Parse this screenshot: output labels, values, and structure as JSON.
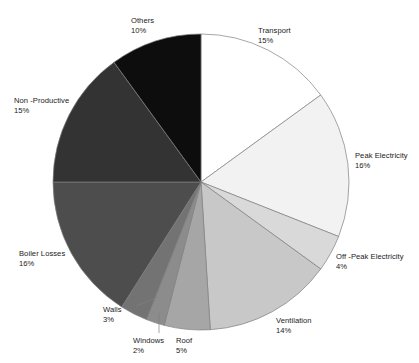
{
  "chart_data": {
    "type": "pie",
    "title": "",
    "subtitle": "",
    "legend_position": "none",
    "grid": false,
    "labels_show_percent": true,
    "start_angle_deg": 0,
    "direction": "clockwise",
    "categories": [
      "Transport",
      "Peak Electricity",
      "Off -Peak Electricity",
      "Ventilation",
      "Roof",
      "Windows",
      "Walls",
      "Boiler Losses",
      "Non -Productive",
      "Others"
    ],
    "values": [
      15,
      16,
      4,
      14,
      5,
      2,
      3,
      16,
      15,
      10
    ],
    "value_labels": [
      "15%",
      "16%",
      "4%",
      "14%",
      "5%",
      "2%",
      "3%",
      "16%",
      "15%",
      "10%"
    ],
    "unit": "%",
    "total": 100,
    "slice_colors": [
      "#ffffff",
      "#f2f2f2",
      "#d9d9d9",
      "#c8c8c8",
      "#a6a6a6",
      "#8c8c8c",
      "#737373",
      "#4d4d4d",
      "#333333",
      "#0d0d0d"
    ],
    "slice_outline_color": "#7f7f7f",
    "label_text_color": "#1a1a1a",
    "background_color": "#ffffff",
    "slices": [
      {
        "name": "Transport",
        "value": 15,
        "value_label": "15%",
        "color": "#ffffff"
      },
      {
        "name": "Peak Electricity",
        "value": 16,
        "value_label": "16%",
        "color": "#f2f2f2"
      },
      {
        "name": "Off -Peak Electricity",
        "value": 4,
        "value_label": "4%",
        "color": "#d9d9d9"
      },
      {
        "name": "Ventilation",
        "value": 14,
        "value_label": "14%",
        "color": "#c8c8c8"
      },
      {
        "name": "Roof",
        "value": 5,
        "value_label": "5%",
        "color": "#a6a6a6"
      },
      {
        "name": "Windows",
        "value": 2,
        "value_label": "2%",
        "color": "#8c8c8c"
      },
      {
        "name": "Walls",
        "value": 3,
        "value_label": "3%",
        "color": "#737373"
      },
      {
        "name": "Boiler Losses",
        "value": 16,
        "value_label": "16%",
        "color": "#4d4d4d"
      },
      {
        "name": "Non -Productive",
        "value": 15,
        "value_label": "15%",
        "color": "#333333"
      },
      {
        "name": "Others",
        "value": 10,
        "value_label": "10%",
        "color": "#0d0d0d"
      }
    ]
  },
  "geometry": {
    "center_x": 201,
    "center_y": 182,
    "radius": 148
  },
  "labels": [
    {
      "key": "transport",
      "name": "Transport",
      "value_label": "15%",
      "x": 258,
      "y": 26,
      "align": "left"
    },
    {
      "key": "peak-electricity",
      "name": "Peak Electricity",
      "value_label": "16%",
      "x": 355,
      "y": 151,
      "align": "left"
    },
    {
      "key": "off-peak",
      "name": "Off -Peak Electricity",
      "value_label": "4%",
      "x": 336,
      "y": 252,
      "align": "left"
    },
    {
      "key": "ventilation",
      "name": "Ventilation",
      "value_label": "14%",
      "x": 276,
      "y": 316,
      "align": "left"
    },
    {
      "key": "roof",
      "name": "Roof",
      "value_label": "5%",
      "x": 176,
      "y": 336,
      "align": "left"
    },
    {
      "key": "windows",
      "name": "Windows",
      "value_label": "2%",
      "x": 133,
      "y": 336,
      "align": "left"
    },
    {
      "key": "walls",
      "name": "Walls",
      "value_label": "3%",
      "x": 103,
      "y": 305,
      "align": "left"
    },
    {
      "key": "boiler-losses",
      "name": "Boiler Losses",
      "value_label": "16%",
      "x": 19,
      "y": 249,
      "align": "left"
    },
    {
      "key": "non-productive",
      "name": "Non -Productive",
      "value_label": "15%",
      "x": 14,
      "y": 96,
      "align": "left"
    },
    {
      "key": "others",
      "name": "Others",
      "value_label": "10%",
      "x": 131,
      "y": 16,
      "align": "left"
    }
  ],
  "leader_lines": [
    {
      "key": "walls-leader",
      "x1": 136,
      "y1": 306,
      "x2": 158,
      "y2": 297
    },
    {
      "key": "windows-leader",
      "x1": 159,
      "y1": 333,
      "x2": 159,
      "y2": 313
    }
  ]
}
